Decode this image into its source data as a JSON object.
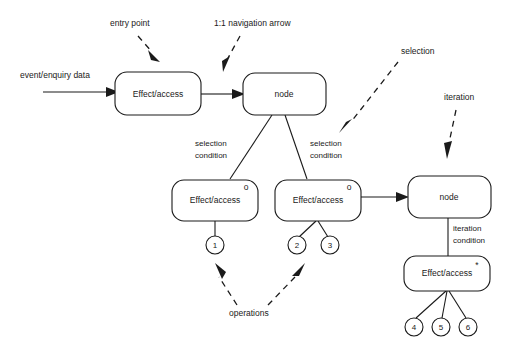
{
  "diagram": {
    "boxes": [
      {
        "id": "effect-access-1",
        "label": "Effect/access",
        "marker": "",
        "x": 115,
        "y": 72,
        "w": 86,
        "h": 43
      },
      {
        "id": "node-1",
        "label": "node",
        "marker": "",
        "x": 243,
        "y": 73,
        "w": 83,
        "h": 42
      },
      {
        "id": "effect-access-2",
        "label": "Effect/access",
        "marker": "o",
        "x": 172,
        "y": 180,
        "w": 86,
        "h": 41
      },
      {
        "id": "effect-access-3",
        "label": "Effect/access",
        "marker": "o",
        "x": 275,
        "y": 180,
        "w": 86,
        "h": 41
      },
      {
        "id": "node-2",
        "label": "node",
        "marker": "",
        "x": 408,
        "y": 176,
        "w": 83,
        "h": 42
      },
      {
        "id": "effect-access-4",
        "label": "Effect/access",
        "marker": "*",
        "x": 404,
        "y": 256,
        "w": 86,
        "h": 35
      }
    ],
    "operation_circles": [
      {
        "id": "op-1",
        "label": "1",
        "cx": 215,
        "cy": 245,
        "r": 9
      },
      {
        "id": "op-2",
        "label": "2",
        "cx": 297,
        "cy": 245,
        "r": 9
      },
      {
        "id": "op-3",
        "label": "3",
        "cx": 330,
        "cy": 245,
        "r": 9
      },
      {
        "id": "op-4",
        "label": "4",
        "cx": 414,
        "cy": 327,
        "r": 9
      },
      {
        "id": "op-5",
        "label": "5",
        "cx": 441,
        "cy": 327,
        "r": 9
      },
      {
        "id": "op-6",
        "label": "6",
        "cx": 468,
        "cy": 327,
        "r": 9
      }
    ],
    "flow_labels": [
      {
        "id": "input-data",
        "text": "event/enquiry data",
        "x": 20,
        "y": 78
      }
    ],
    "edge_labels": [
      {
        "id": "selection-condition-left",
        "line1": "selection",
        "line2": "condition",
        "x": 195,
        "y": 146
      },
      {
        "id": "selection-condition-right",
        "line1": "selection",
        "line2": "condition",
        "x": 310,
        "y": 146
      },
      {
        "id": "iteration-condition",
        "line1": "iteration",
        "line2": "condition",
        "x": 443,
        "y": 231
      }
    ],
    "annotations": [
      {
        "id": "entry-point",
        "text": "entry point",
        "x": 110,
        "y": 26
      },
      {
        "id": "one-to-one-navigation-arrow",
        "text": "1:1 navigation arrow",
        "x": 214,
        "y": 26
      },
      {
        "id": "selection",
        "text": "selection",
        "x": 401,
        "y": 54
      },
      {
        "id": "iteration",
        "text": "iteration",
        "x": 444,
        "y": 100
      },
      {
        "id": "operations",
        "text": "operations",
        "x": 229,
        "y": 316
      }
    ],
    "colors": {
      "stroke": "#1a1a1a",
      "fill": "#ffffff",
      "background": "#ffffff"
    }
  }
}
